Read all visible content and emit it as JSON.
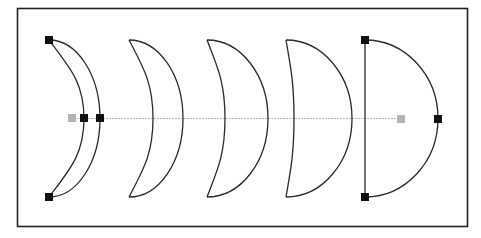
{
  "diagram": {
    "frame": {
      "x": 17,
      "y": 8,
      "w": 450,
      "h": 218,
      "stroke": "#222222"
    },
    "axis_line": {
      "y": 119,
      "x1": 70,
      "x2": 402,
      "color": "#b8b8b8"
    },
    "colors": {
      "stroke": "#2a2a2a",
      "handle": "#111111",
      "handle_gray": "#b5b5b5"
    },
    "shapes": [
      {
        "name": "crescent-1",
        "top": [
          49,
          40
        ],
        "bottom": [
          49,
          197
        ],
        "inner_x": 84,
        "outer_x": 100,
        "handles": true
      },
      {
        "name": "crescent-2",
        "top": [
          129,
          40
        ],
        "bottom": [
          129,
          197
        ],
        "inner_x": 153,
        "outer_x": 183,
        "handles": false
      },
      {
        "name": "crescent-3",
        "top": [
          207,
          40
        ],
        "bottom": [
          207,
          197
        ],
        "inner_x": 225,
        "outer_x": 268,
        "handles": false
      },
      {
        "name": "crescent-4",
        "top": [
          286,
          40
        ],
        "bottom": [
          286,
          197
        ],
        "inner_x": 294,
        "outer_x": 352,
        "handles": false
      },
      {
        "name": "half-circle",
        "top": [
          365,
          40
        ],
        "bottom": [
          365,
          197
        ],
        "inner_x": 365,
        "outer_x": 438,
        "handles": true
      }
    ],
    "handles": {
      "black": [
        [
          49,
          40
        ],
        [
          49,
          197
        ],
        [
          84,
          118
        ],
        [
          100,
          118
        ],
        [
          365,
          40
        ],
        [
          365,
          197
        ],
        [
          438,
          119
        ]
      ],
      "gray": [
        [
          72,
          118
        ],
        [
          401,
          119
        ]
      ]
    }
  }
}
